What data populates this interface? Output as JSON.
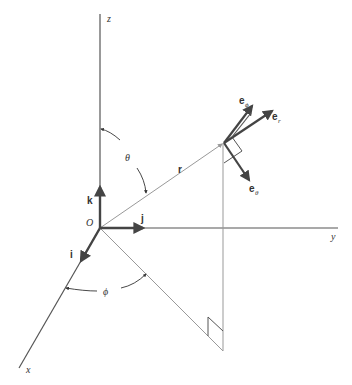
{
  "diagram": {
    "axes": {
      "z": "z",
      "y": "y",
      "x": "x"
    },
    "origin": "O",
    "cartesian_unit_vectors": {
      "i": "i",
      "j": "j",
      "k": "k"
    },
    "position_vector": "r",
    "angles": {
      "theta": "θ",
      "phi": "ϕ"
    },
    "spherical_unit_vectors": {
      "e_r": {
        "base": "e",
        "sub": "r"
      },
      "e_theta": {
        "base": "e",
        "sub": "θ"
      },
      "e_phi": {
        "base": "e",
        "sub": "ϕ"
      }
    },
    "colors": {
      "axis": "#555555",
      "vector": "#444444",
      "construction": "#999999"
    }
  }
}
